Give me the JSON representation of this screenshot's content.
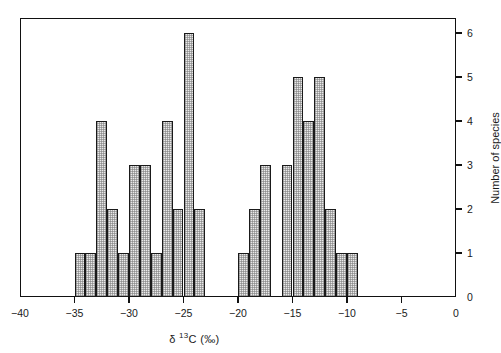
{
  "figure": {
    "background": "#ffffff",
    "frame_color": "#111111",
    "bar_fill": "#e9e9e9",
    "bar_edge": "#1a1a1a"
  },
  "axes": {
    "x_label_prefix": "δ ",
    "x_label_superscript": "13",
    "x_label_suffix": "C (‰)",
    "x_label_full": "δ 13C (‰)",
    "y_label": "Number of species",
    "x_ticks": [
      -40,
      -35,
      -30,
      -25,
      -20,
      -15,
      -10,
      -5,
      0
    ],
    "x_tick_labels": [
      "−40",
      "−35",
      "−30",
      "−25",
      "−20",
      "−15",
      "−10",
      "−5",
      "0"
    ],
    "y_ticks": [
      0,
      1,
      2,
      3,
      4,
      5,
      6
    ],
    "y_tick_labels": [
      "0",
      "1",
      "2",
      "3",
      "4",
      "5",
      "6"
    ],
    "y_axis_side": "right",
    "grid": false
  },
  "chart_data": {
    "type": "bar",
    "title": "",
    "subtitle": "",
    "xlabel": "δ 13C (‰)",
    "ylabel": "Number of species",
    "xlim": [
      -40,
      0
    ],
    "ylim": [
      0,
      6.6
    ],
    "bin_width": 1,
    "grid": false,
    "legend": null,
    "annotations": [],
    "bins": [
      {
        "x0": -35,
        "x1": -34,
        "value": 1
      },
      {
        "x0": -34,
        "x1": -33,
        "value": 1
      },
      {
        "x0": -33,
        "x1": -32,
        "value": 4
      },
      {
        "x0": -32,
        "x1": -31,
        "value": 2
      },
      {
        "x0": -31,
        "x1": -30,
        "value": 1
      },
      {
        "x0": -30,
        "x1": -29,
        "value": 3
      },
      {
        "x0": -29,
        "x1": -28,
        "value": 3
      },
      {
        "x0": -28,
        "x1": -27,
        "value": 1
      },
      {
        "x0": -27,
        "x1": -26,
        "value": 4
      },
      {
        "x0": -26,
        "x1": -25,
        "value": 2
      },
      {
        "x0": -25,
        "x1": -24,
        "value": 6
      },
      {
        "x0": -24,
        "x1": -23,
        "value": 2
      },
      {
        "x0": -20,
        "x1": -19,
        "value": 1
      },
      {
        "x0": -19,
        "x1": -18,
        "value": 2
      },
      {
        "x0": -18,
        "x1": -17,
        "value": 3
      },
      {
        "x0": -16,
        "x1": -15,
        "value": 3
      },
      {
        "x0": -15,
        "x1": -14,
        "value": 5
      },
      {
        "x0": -14,
        "x1": -13,
        "value": 4
      },
      {
        "x0": -13,
        "x1": -12,
        "value": 5
      },
      {
        "x0": -12,
        "x1": -11,
        "value": 2
      },
      {
        "x0": -11,
        "x1": -10,
        "value": 1
      },
      {
        "x0": -10,
        "x1": -9,
        "value": 1
      }
    ],
    "categories": [
      "-35",
      "-34",
      "-33",
      "-32",
      "-31",
      "-30",
      "-29",
      "-28",
      "-27",
      "-26",
      "-25",
      "-24",
      "-20",
      "-19",
      "-18",
      "-16",
      "-15",
      "-14",
      "-13",
      "-12",
      "-11",
      "-10"
    ],
    "values": [
      1,
      1,
      4,
      2,
      1,
      3,
      3,
      1,
      4,
      2,
      6,
      2,
      1,
      2,
      3,
      3,
      5,
      4,
      5,
      2,
      1,
      1
    ]
  }
}
